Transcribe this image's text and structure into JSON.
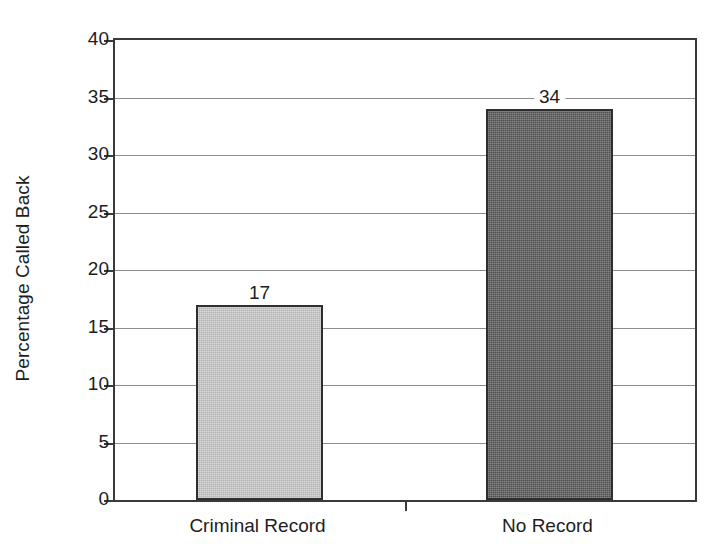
{
  "chart_data": {
    "type": "bar",
    "title": "",
    "subtitle": "",
    "xlabel": "",
    "ylabel": "Percentage Called Back",
    "categories": [
      "Criminal Record",
      "No Record"
    ],
    "values": [
      17,
      34
    ],
    "value_labels": [
      "17",
      "34"
    ],
    "series": [
      {
        "name": "Percentage Called Back",
        "values": [
          17,
          34
        ]
      }
    ],
    "ylim": [
      0,
      40
    ],
    "ytick_values": [
      0,
      5,
      10,
      15,
      20,
      25,
      30,
      35,
      40
    ],
    "ytick_labels": [
      "0",
      "5",
      "10",
      "15",
      "20",
      "25",
      "30",
      "35",
      "40"
    ],
    "ytick_step": 5,
    "grid": true,
    "grid_axis": "y",
    "legend": false,
    "legend_position": "none",
    "bar_colors": [
      "#c9c9c9",
      "#575757"
    ],
    "bar_edge_color": "#2e2e2e",
    "axis_color": "#3a3a3a",
    "grid_color": "#8c8c8c",
    "background_color": "#ffffff",
    "text_color": "#1d1d1d"
  },
  "axis": {
    "y_title": "Percentage Called Back"
  },
  "bars": [
    {
      "category": "Criminal Record",
      "value": 17,
      "label": "17",
      "color": "#c9c9c9"
    },
    {
      "category": "No Record",
      "value": 34,
      "label": "34",
      "color": "#575757"
    }
  ],
  "yticks": [
    {
      "label": "40",
      "value": 40
    },
    {
      "label": "35",
      "value": 35
    },
    {
      "label": "30",
      "value": 30
    },
    {
      "label": "25",
      "value": 25
    },
    {
      "label": "20",
      "value": 20
    },
    {
      "label": "15",
      "value": 15
    },
    {
      "label": "10",
      "value": 10
    },
    {
      "label": "5",
      "value": 5
    },
    {
      "label": "0",
      "value": 0
    }
  ]
}
